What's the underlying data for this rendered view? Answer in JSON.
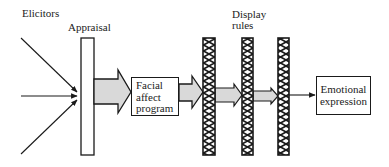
{
  "diagram": {
    "labels": {
      "elicitors": "Elicitors",
      "appraisal": "Appraisal",
      "display_rules_line1": "Display",
      "display_rules_line2": "rules"
    },
    "boxes": {
      "facial_affect_program": [
        "Facial",
        "affect",
        "program"
      ],
      "emotional_expression": [
        "Emotional",
        "expression"
      ]
    },
    "colors": {
      "line": "#1a1a1a",
      "arrow_fill": "#d9d9d9",
      "background": "#ffffff"
    },
    "flow": [
      "Elicitors",
      "Appraisal",
      "Facial affect program",
      "Display rules",
      "Emotional expression"
    ]
  }
}
